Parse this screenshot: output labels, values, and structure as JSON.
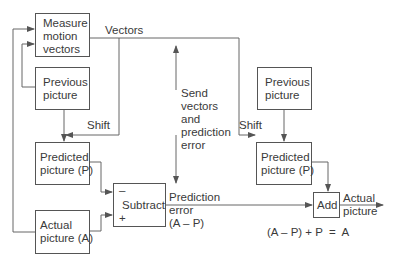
{
  "diagram": {
    "type": "block-diagram",
    "colors": {
      "line": "#555555",
      "text": "#3a3a3a",
      "background": "#ffffff"
    },
    "encoder": {
      "measure_box": "Measure\nmotion\nvectors",
      "previous_box": "Previous\npicture",
      "predicted_box": "Predicted\npicture (P)",
      "actual_box": "Actual\npicture (A)",
      "subtract_box": "Subtract",
      "minus_sign": "–",
      "plus_sign": "+",
      "vectors_label": "Vectors",
      "shift_label": "Shift"
    },
    "channel": {
      "send_label": "Send\nvectors\nand\nprediction\nerror",
      "prediction_error_label": "Prediction\nerror\n(A – P)"
    },
    "decoder": {
      "previous_box": "Previous\npicture",
      "predicted_box": "Predicted\npicture (P)",
      "add_box": "Add",
      "shift_label": "Shift",
      "output_label": "Actual\npicture",
      "equation": "(A – P) + P  =  A"
    }
  }
}
